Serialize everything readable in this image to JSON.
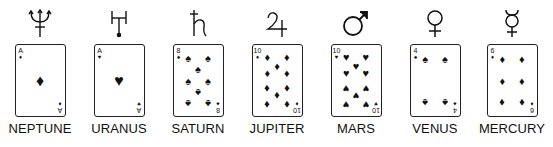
{
  "planets": [
    {
      "name": "NEPTUNE",
      "symbol": "neptune",
      "card": {
        "rank": "A",
        "suit": "♦",
        "suit_name": "diamonds"
      }
    },
    {
      "name": "URANUS",
      "symbol": "uranus",
      "card": {
        "rank": "A",
        "suit": "♥",
        "suit_name": "hearts"
      }
    },
    {
      "name": "SATURN",
      "symbol": "saturn",
      "card": {
        "rank": "8",
        "suit": "♠",
        "suit_name": "spades"
      }
    },
    {
      "name": "JUPITER",
      "symbol": "jupiter",
      "card": {
        "rank": "10",
        "suit": "♦",
        "suit_name": "diamonds"
      }
    },
    {
      "name": "MARS",
      "symbol": "mars",
      "card": {
        "rank": "10",
        "suit": "♥",
        "suit_name": "hearts"
      }
    },
    {
      "name": "VENUS",
      "symbol": "venus",
      "card": {
        "rank": "4",
        "suit": "♠",
        "suit_name": "spades"
      }
    },
    {
      "name": "MERCURY",
      "symbol": "mercury",
      "card": {
        "rank": "6",
        "suit": "♦",
        "suit_name": "diamonds"
      }
    }
  ]
}
